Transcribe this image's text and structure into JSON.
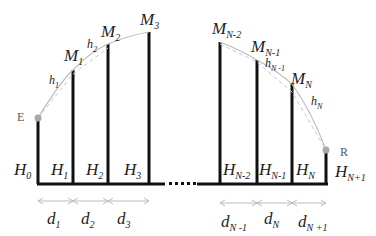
{
  "diagram": {
    "endpoints": {
      "start": "E",
      "end": "R"
    },
    "peaks": [
      {
        "base": "M",
        "sub": "1"
      },
      {
        "base": "M",
        "sub": "2"
      },
      {
        "base": "M",
        "sub": "3"
      },
      {
        "base": "M",
        "sub": "N-2"
      },
      {
        "base": "M",
        "sub": "N-1"
      },
      {
        "base": "M",
        "sub": "N"
      }
    ],
    "segments": [
      {
        "base": "h",
        "sub": "1"
      },
      {
        "base": "h",
        "sub": "2"
      },
      {
        "base": "h",
        "sub": "N -1"
      },
      {
        "base": "h",
        "sub": "N"
      }
    ],
    "heights": [
      {
        "base": "H",
        "sub": "0"
      },
      {
        "base": "H",
        "sub": "1"
      },
      {
        "base": "H",
        "sub": "2"
      },
      {
        "base": "H",
        "sub": "3"
      },
      {
        "base": "H",
        "sub": "N-2"
      },
      {
        "base": "H",
        "sub": "N-1"
      },
      {
        "base": "H",
        "sub": "N"
      },
      {
        "base": "H",
        "sub": "N+1"
      }
    ],
    "distances": [
      {
        "base": "d",
        "sub": "1"
      },
      {
        "base": "d",
        "sub": "2"
      },
      {
        "base": "d",
        "sub": "3"
      },
      {
        "base": "d",
        "sub": "N -1"
      },
      {
        "base": "d",
        "sub": "N"
      },
      {
        "base": "d",
        "sub": "N +1"
      }
    ],
    "ellipsis": "·····",
    "colors": {
      "bars": "#111111",
      "curve": "#bdbdbd",
      "dashed": "#c8c8c8",
      "endpoint": "#a9a9a9",
      "arrows": "#bcbcbc"
    }
  }
}
